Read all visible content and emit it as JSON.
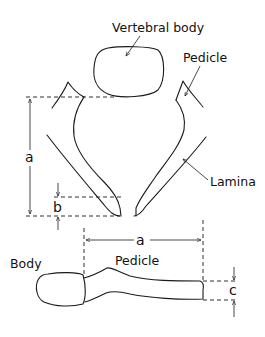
{
  "figure": {
    "top_view": {
      "labels": {
        "vertebral_body": "Vertebral body",
        "pedicle": "Pedicle",
        "lamina": "Lamina"
      },
      "dimensions": {
        "a": "a",
        "b": "b"
      }
    },
    "side_view": {
      "labels": {
        "body": "Body",
        "pedicle": "Pedicle"
      },
      "dimensions": {
        "a": "a",
        "c": "c"
      }
    }
  },
  "colors": {
    "line": "#1a1a1a",
    "background": "#ffffff"
  }
}
